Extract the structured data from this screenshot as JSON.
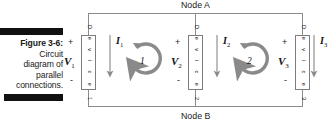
{
  "figure": {
    "caption_label": "Figure 3-6:",
    "caption_lines": [
      "Circuit",
      "diagram of",
      "parallel",
      "connections."
    ],
    "nodes": {
      "top_label": "Node A",
      "bottom_label": "Node B"
    },
    "branches": [
      {
        "plus": "+",
        "minus": "-",
        "voltage": "V",
        "voltage_sub": "1",
        "device_text": "Device 1",
        "device_chars": [
          "D",
          "e",
          "v",
          "i",
          "c",
          "e",
          "1"
        ],
        "current": "I",
        "current_sub": "1",
        "current_direction": "down"
      },
      {
        "plus": "+",
        "minus": "-",
        "voltage": "V",
        "voltage_sub": "2",
        "device_text": "Device 2",
        "device_chars": [
          "D",
          "e",
          "v",
          "i",
          "c",
          "e",
          "2"
        ],
        "current": "I",
        "current_sub": "2",
        "current_direction": "down"
      },
      {
        "plus": "+",
        "minus": "-",
        "voltage": "V",
        "voltage_sub": "3",
        "device_text": "Device 3",
        "device_chars": [
          "D",
          "e",
          "v",
          "i",
          "c",
          "e",
          "3"
        ],
        "current": "I",
        "current_sub": "3",
        "current_direction": "down"
      }
    ],
    "loops": [
      {
        "label": "1",
        "direction": "clockwise"
      },
      {
        "label": "2",
        "direction": "clockwise"
      }
    ],
    "colors": {
      "wire": "#8c8c8c",
      "box_border": "#7d7d7d",
      "text": "#1a1a1a",
      "rule_bar": "#111111",
      "loop_arrow": "#8a8a8a",
      "background": "#ffffff"
    }
  }
}
